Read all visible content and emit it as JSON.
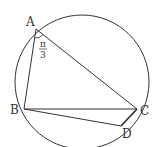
{
  "diagram": {
    "type": "inscribed quadrilateral in circle",
    "circle": {
      "cx": 82,
      "cy": 82,
      "r": 67
    },
    "points": {
      "A": {
        "label": "A",
        "x": 36,
        "y": 29
      },
      "B": {
        "label": "B",
        "x": 24,
        "y": 109
      },
      "C": {
        "label": "C",
        "x": 137,
        "y": 109
      },
      "D": {
        "label": "D",
        "x": 121,
        "y": 126
      }
    },
    "segments": [
      "AB",
      "AC",
      "BC",
      "BD",
      "CD"
    ],
    "angle_mark": {
      "vertex": "A",
      "numerator": "π",
      "denominator": "3"
    },
    "stroke_color": "#333333"
  }
}
